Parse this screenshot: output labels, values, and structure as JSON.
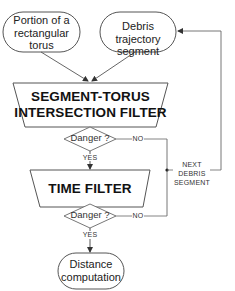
{
  "diagram": {
    "type": "flowchart",
    "nodes": {
      "torus_input": {
        "label_lines": [
          "Portion of a",
          "rectangular",
          "torus"
        ],
        "shape": "rounded-oval"
      },
      "segment_input": {
        "label_lines": [
          "Debris trajectory",
          "segment"
        ],
        "shape": "rounded-oval"
      },
      "seg_torus_filter": {
        "label_lines": [
          "SEGMENT-TORUS",
          "INTERSECTION FILTER"
        ],
        "shape": "trapezoid"
      },
      "danger1": {
        "label": "Danger ?",
        "shape": "diamond"
      },
      "time_filter": {
        "label": "TIME FILTER",
        "shape": "trapezoid"
      },
      "danger2": {
        "label": "Danger ?",
        "shape": "diamond"
      },
      "distance": {
        "label_lines": [
          "Distance",
          "computation"
        ],
        "shape": "rounded-oval"
      }
    },
    "edge_labels": {
      "yes1": "YES",
      "no1": "NO",
      "yes2": "YES",
      "no2": "NO",
      "loop_lines": [
        "NEXT",
        "DEBRIS",
        "SEGMENT"
      ]
    },
    "colors": {
      "stroke": "#444444",
      "background": "#ffffff",
      "text": "#222222"
    }
  }
}
